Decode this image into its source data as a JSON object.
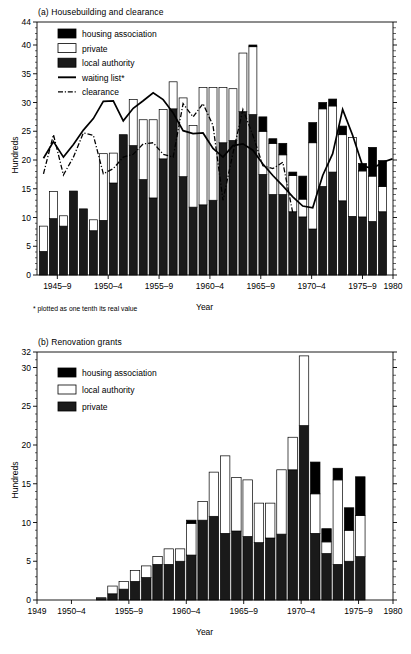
{
  "figure": {
    "panel_a": {
      "title": "(a) Housebuilding and clearance",
      "ylabel": "Hundreds",
      "xlabel": "Year",
      "footnote": "* plotted as one tenth its real value",
      "legend": [
        {
          "label": "housing association",
          "style": "solid",
          "color": "#000000"
        },
        {
          "label": "private",
          "style": "open",
          "color": "#ffffff"
        },
        {
          "label": "local authority",
          "style": "solid",
          "color": "#1a1a1a"
        },
        {
          "label": "waiting list*",
          "style": "line",
          "color": "#000000"
        },
        {
          "label": "clearance",
          "style": "dashline",
          "color": "#000000"
        }
      ]
    },
    "panel_b": {
      "title": "(b) Renovation grants",
      "ylabel": "Hundreds",
      "xlabel": "Year",
      "legend": [
        {
          "label": "housing association",
          "style": "solid",
          "color": "#000000"
        },
        {
          "label": "local authority",
          "style": "open",
          "color": "#ffffff"
        },
        {
          "label": "private",
          "style": "solid",
          "color": "#1a1a1a"
        }
      ]
    }
  },
  "chart_data": [
    {
      "id": "panel_a",
      "type": "bar",
      "title": "(a) Housebuilding and clearance",
      "subtitle": "",
      "xlabel": "Year",
      "ylabel": "Hundreds",
      "annotations": [
        "* plotted as one tenth its real value"
      ],
      "grid": false,
      "legend_position": "top-left",
      "stacked": true,
      "ylim": [
        0,
        44
      ],
      "yticks": [
        0,
        5,
        10,
        15,
        20,
        25,
        30,
        35,
        40,
        44
      ],
      "xlim": [
        1945,
        1980
      ],
      "xticks": [
        {
          "value": 1947,
          "label": "1945–9"
        },
        {
          "value": 1952,
          "label": "1950–4"
        },
        {
          "value": 1957,
          "label": "1955–9"
        },
        {
          "value": 1962,
          "label": "1960–4"
        },
        {
          "value": 1967,
          "label": "1965–9"
        },
        {
          "value": 1972,
          "label": "1970–4"
        },
        {
          "value": 1977,
          "label": "1975–9"
        },
        {
          "value": 1980,
          "label": "1980"
        }
      ],
      "categories": [
        1945,
        1946,
        1947,
        1948,
        1949,
        1950,
        1951,
        1952,
        1953,
        1954,
        1955,
        1956,
        1957,
        1958,
        1959,
        1960,
        1961,
        1962,
        1963,
        1964,
        1965,
        1966,
        1967,
        1968,
        1969,
        1970,
        1971,
        1972,
        1973,
        1974,
        1975,
        1976,
        1977,
        1978,
        1979
      ],
      "series": [
        {
          "name": "local authority",
          "color": "#1a1a1a",
          "values": [
            4.1,
            9.8,
            8.5,
            14.6,
            11.5,
            7.7,
            9.5,
            16.0,
            24.4,
            22.5,
            16.6,
            13.4,
            20.2,
            28.9,
            17.1,
            11.8,
            12.2,
            13.0,
            23.0,
            23.4,
            28.4,
            27.9,
            17.5,
            14.0,
            14.0,
            11.0,
            10.1,
            8.0,
            15.4,
            17.9,
            12.9,
            10.2,
            10.1,
            9.3,
            11.0,
            12.5
          ]
        },
        {
          "name": "private",
          "color": "#ffffff",
          "values": [
            4.4,
            4.7,
            1.8,
            0.0,
            0.0,
            1.9,
            11.6,
            5.2,
            0.0,
            8.0,
            10.4,
            13.6,
            8.6,
            4.7,
            13.7,
            14.2,
            20.4,
            19.6,
            9.6,
            9.0,
            10.2,
            11.8,
            7.5,
            8.9,
            6.9,
            6.3,
            3.1,
            15.0,
            13.5,
            11.5,
            11.5,
            13.7,
            8.0,
            7.9,
            4.4,
            10.5
          ]
        },
        {
          "name": "housing association",
          "color": "#000000",
          "values": [
            0.0,
            0.0,
            0.0,
            0.0,
            0.0,
            0.0,
            0.0,
            0.0,
            0.0,
            0.0,
            0.0,
            0.0,
            0.0,
            0.0,
            0.0,
            0.0,
            0.0,
            0.0,
            0.0,
            0.0,
            0.0,
            0.3,
            2.5,
            0.8,
            2.0,
            0.6,
            4.0,
            3.5,
            1.1,
            1.2,
            1.5,
            0.0,
            1.3,
            5.0,
            4.5,
            5.0
          ]
        }
      ],
      "line_series": [
        {
          "name": "waiting list*",
          "style": "solid",
          "color": "#000000",
          "x": [
            1945,
            1946,
            1947,
            1948,
            1949,
            1950,
            1951,
            1952,
            1953,
            1954,
            1955,
            1956,
            1957,
            1958,
            1959,
            1960,
            1961,
            1962,
            1963,
            1964,
            1965,
            1966,
            1967,
            1968,
            1969,
            1970,
            1971,
            1972,
            1973,
            1974,
            1975,
            1976,
            1977,
            1978,
            1979
          ],
          "values": [
            20.3,
            23.2,
            20.5,
            22.7,
            25.2,
            27.2,
            30.2,
            30.3,
            26.8,
            29.0,
            30.3,
            31.7,
            30.5,
            28.2,
            25.1,
            24.6,
            24.7,
            22.0,
            20.5,
            22.5,
            22.8,
            21.7,
            19.3,
            17.3,
            15.5,
            13.6,
            12.0,
            11.7,
            17.3,
            21.1,
            28.8,
            24.3,
            19.0,
            18.5,
            19.6,
            20.2
          ]
        },
        {
          "name": "clearance",
          "style": "dashdot",
          "color": "#000000",
          "x": [
            1955,
            1956,
            1957,
            1958,
            1959,
            1960,
            1961,
            1962,
            1963,
            1964,
            1965,
            1966,
            1967,
            1968,
            1969,
            1970,
            1971,
            1972,
            1973,
            1974,
            1975,
            1976,
            1977,
            1978,
            1979
          ],
          "values": [
            17.6,
            24.4,
            17.4,
            20.5,
            24.7,
            24.3,
            17.6,
            18.5,
            20.5,
            21.0,
            22.8,
            23.0,
            21.0,
            20.5,
            29.8,
            27.5,
            29.8,
            26.0,
            13.0,
            21.2,
            28.8,
            24.3,
            19.0,
            18.5,
            19.6,
            10.8
          ]
        }
      ]
    },
    {
      "id": "panel_b",
      "type": "bar",
      "title": "(b) Renovation grants",
      "subtitle": "",
      "xlabel": "Year",
      "ylabel": "Hundreds",
      "grid": false,
      "legend_position": "top-left",
      "stacked": true,
      "ylim": [
        0,
        32
      ],
      "yticks": [
        0,
        5,
        10,
        15,
        20,
        25,
        30,
        32
      ],
      "xlim": [
        1949,
        1980
      ],
      "xticks": [
        {
          "value": 1949,
          "label": "1949"
        },
        {
          "value": 1952,
          "label": "1950–4"
        },
        {
          "value": 1957,
          "label": "1955–9"
        },
        {
          "value": 1962,
          "label": "1960–4"
        },
        {
          "value": 1967,
          "label": "1965–9"
        },
        {
          "value": 1972,
          "label": "1970–4"
        },
        {
          "value": 1977,
          "label": "1975–9"
        },
        {
          "value": 1980,
          "label": "1980"
        }
      ],
      "categories": [
        1949,
        1950,
        1951,
        1952,
        1953,
        1954,
        1955,
        1956,
        1957,
        1958,
        1959,
        1960,
        1961,
        1962,
        1963,
        1964,
        1965,
        1966,
        1967,
        1968,
        1969,
        1970,
        1971,
        1972,
        1973,
        1974,
        1975,
        1976,
        1977,
        1978,
        1979
      ],
      "series": [
        {
          "name": "private",
          "color": "#1a1a1a",
          "values": [
            0.0,
            0.0,
            0.0,
            0.0,
            0.0,
            0.2,
            0.8,
            1.4,
            2.4,
            2.9,
            4.6,
            4.6,
            5.0,
            5.8,
            10.3,
            10.8,
            8.6,
            8.9,
            8.2,
            7.4,
            8.0,
            8.5,
            16.8,
            22.5,
            8.6,
            6.0,
            4.6,
            5.0,
            5.6
          ]
        },
        {
          "name": "local authority",
          "color": "#ffffff",
          "values": [
            0.0,
            0.0,
            0.0,
            0.0,
            0.0,
            0.1,
            1.0,
            1.0,
            1.4,
            1.5,
            1.0,
            2.0,
            1.6,
            4.1,
            2.4,
            5.7,
            10.0,
            6.9,
            7.3,
            5.1,
            4.5,
            8.3,
            4.2,
            9.0,
            5.1,
            1.5,
            10.9,
            4.0,
            5.3
          ]
        },
        {
          "name": "housing association",
          "color": "#000000",
          "values": [
            0.0,
            0.0,
            0.0,
            0.0,
            0.0,
            0.0,
            0.0,
            0.0,
            0.0,
            0.0,
            0.0,
            0.0,
            0.0,
            0.4,
            0.0,
            0.0,
            0.0,
            0.0,
            0.0,
            0.0,
            0.0,
            0.0,
            0.0,
            0.0,
            4.1,
            1.7,
            1.5,
            2.9,
            5.0
          ]
        }
      ]
    }
  ]
}
